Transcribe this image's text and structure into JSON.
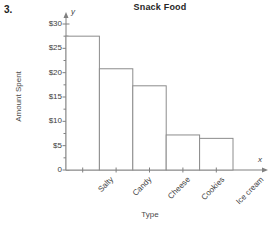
{
  "problem": {
    "number": "3."
  },
  "chart_data": {
    "type": "bar",
    "title": "Snack Food",
    "xlabel": "Type",
    "ylabel": "Amount Spent",
    "categories": [
      "Salty",
      "Candy",
      "Cheese",
      "Cookies",
      "Ice cream"
    ],
    "values": [
      27.5,
      20.8,
      17.3,
      7.2,
      6.5
    ],
    "ylim": [
      0,
      31
    ],
    "ytick_values": [
      0,
      5,
      10,
      15,
      20,
      25,
      30
    ],
    "ytick_labels": [
      "0",
      "$5",
      "$10",
      "$15",
      "$20",
      "$25",
      "$30"
    ],
    "grid": false,
    "legend": false,
    "axis_end_labels": {
      "x": "x",
      "y": "y"
    },
    "bar_fill": "#ffffff",
    "bar_edge": "#8c8c8c",
    "axis_color": "#808080"
  }
}
